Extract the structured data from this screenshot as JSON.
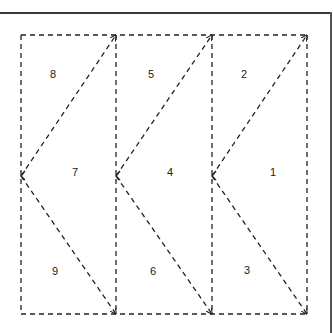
{
  "diagram": {
    "line_style": "dashed",
    "stroke_color": "#222222",
    "columns": [
      {
        "index": 0,
        "regions": [
          {
            "label": "8",
            "position": "top"
          },
          {
            "label": "7",
            "position": "middle"
          },
          {
            "label": "9",
            "position": "bottom"
          }
        ]
      },
      {
        "index": 1,
        "regions": [
          {
            "label": "5",
            "position": "top"
          },
          {
            "label": "4",
            "position": "middle"
          },
          {
            "label": "6",
            "position": "bottom"
          }
        ]
      },
      {
        "index": 2,
        "regions": [
          {
            "label": "2",
            "position": "top"
          },
          {
            "label": "1",
            "position": "middle"
          },
          {
            "label": "3",
            "position": "bottom"
          }
        ]
      }
    ],
    "arrows": [
      {
        "from": "column-left-middle",
        "to": "column-top-right",
        "head": "end"
      },
      {
        "from": "column-left-middle",
        "to": "column-bottom-right",
        "head": "end"
      }
    ]
  }
}
